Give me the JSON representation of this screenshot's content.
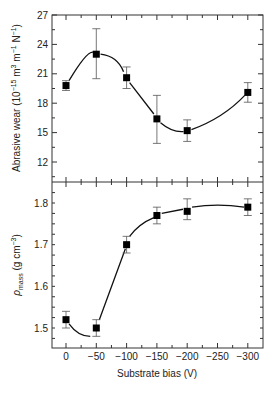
{
  "chart_data": [
    {
      "type": "line",
      "panel": "top",
      "title": "",
      "xlabel": "Substrate bias (V)",
      "ylabel": "Abrasive wear (10^-15 m^3 m^-1 N^-1)",
      "ylabel_parts": {
        "main": "Abrasive wear (10",
        "exp1": "−15",
        "mid1": " m",
        "exp2": "3",
        "mid2": " m",
        "exp3": "−1",
        "mid3": " N",
        "exp4": "−1",
        "end": ")"
      },
      "x": [
        0,
        -50,
        -100,
        -150,
        -200,
        -300
      ],
      "values": [
        19.8,
        23.0,
        20.6,
        16.4,
        15.2,
        19.1
      ],
      "error_low": [
        19.3,
        20.5,
        19.5,
        13.9,
        14.1,
        18.1
      ],
      "error_high": [
        20.3,
        25.6,
        21.7,
        18.8,
        16.3,
        20.1
      ],
      "yticks": [
        "27",
        "24",
        "21",
        "18",
        "15",
        "12"
      ],
      "ylim": [
        9.5,
        27
      ],
      "grid": false
    },
    {
      "type": "line",
      "panel": "bottom",
      "title": "",
      "xlabel": "Substrate bias (V)",
      "ylabel": "ρmass (g cm^-3)",
      "ylabel_parts": {
        "rho": "ρ",
        "sub": "mass",
        "rest": " (g cm",
        "exp": "−3",
        "end": ")"
      },
      "x": [
        0,
        -50,
        -100,
        -150,
        -200,
        -300
      ],
      "values": [
        1.52,
        1.5,
        1.7,
        1.77,
        1.78,
        1.79
      ],
      "error_low": [
        1.5,
        1.48,
        1.68,
        1.75,
        1.76,
        1.77
      ],
      "error_high": [
        1.54,
        1.52,
        1.72,
        1.79,
        1.81,
        1.81
      ],
      "yticks": [
        "1.8",
        "1.7",
        "1.6",
        "1.5"
      ],
      "xticks": [
        "0",
        "−50",
        "−100",
        "−150",
        "−200",
        "−250",
        "−300"
      ],
      "ylim": [
        1.45,
        1.85
      ],
      "grid": false
    }
  ]
}
